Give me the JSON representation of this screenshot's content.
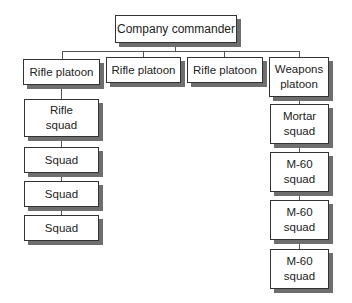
{
  "diagram": {
    "type": "org-chart",
    "root": {
      "label": "Company commander"
    },
    "platoons": [
      {
        "label": "Rifle platoon",
        "children": [
          {
            "label": "Rifle\nsquad"
          },
          {
            "label": "Squad"
          },
          {
            "label": "Squad"
          },
          {
            "label": "Squad"
          }
        ]
      },
      {
        "label": "Rifle platoon",
        "children": []
      },
      {
        "label": "Rifle platoon",
        "children": []
      },
      {
        "label": "Weapons\nplatoon",
        "children": [
          {
            "label": "Mortar\nsquad"
          },
          {
            "label": "M-60\nsquad"
          },
          {
            "label": "M-60\nsquad"
          },
          {
            "label": "M-60\nsquad"
          }
        ]
      }
    ]
  },
  "colors": {
    "line": "#555555",
    "border": "#333333",
    "shadow": "#6e6e6e",
    "background": "#ffffff"
  }
}
